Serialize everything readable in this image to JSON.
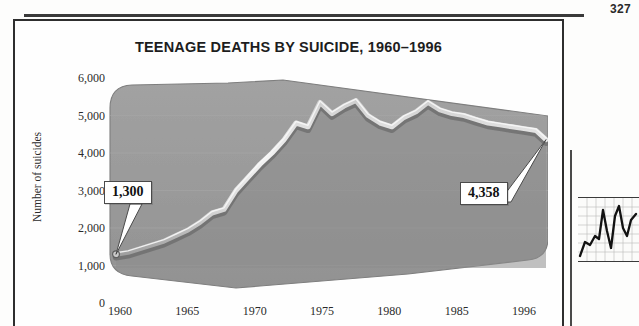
{
  "page": {
    "folio": "327"
  },
  "figure": {
    "title": "TEENAGE DEATHS BY SUICIDE, 1960–1996"
  },
  "callouts": [
    {
      "name": "start-value",
      "text": "1,300"
    },
    {
      "name": "end-value",
      "text": "4,358"
    }
  ],
  "colors": {
    "area_fill": "#9b9b9b",
    "area_fill_dark": "#8a8a8a",
    "line_light": "#f0f0f0",
    "line_shadow": "#6e6e6e",
    "frame": "#2e2e2e",
    "text": "#1d1d1d"
  },
  "chart_data": {
    "type": "line",
    "title": "TEENAGE DEATHS BY SUICIDE, 1960–1996",
    "xlabel": "",
    "ylabel": "Number of suicides",
    "xlim": [
      1960,
      1996
    ],
    "ylim": [
      0,
      6000
    ],
    "yticks": [
      0,
      1000,
      2000,
      3000,
      4000,
      5000,
      6000
    ],
    "ytick_labels": [
      "0",
      "1,000",
      "2,000",
      "3,000",
      "4,000",
      "5,000",
      "6,000"
    ],
    "xticks": [
      1960,
      1965,
      1970,
      1975,
      1980,
      1985,
      1996
    ],
    "xtick_labels": [
      "1960",
      "1965",
      "1970",
      "1975",
      "1980",
      "1985",
      "1996"
    ],
    "grid": "horizontal-faint",
    "legend": "none",
    "annotations": [
      {
        "label": "1,300",
        "x": 1960,
        "y": 1300
      },
      {
        "label": "4,358",
        "x": 1996,
        "y": 4358
      }
    ],
    "x": [
      1960,
      1961,
      1962,
      1963,
      1964,
      1965,
      1966,
      1967,
      1968,
      1969,
      1970,
      1971,
      1972,
      1973,
      1974,
      1975,
      1976,
      1977,
      1978,
      1979,
      1980,
      1981,
      1982,
      1983,
      1984,
      1985,
      1986,
      1987,
      1988,
      1989,
      1990,
      1991,
      1992,
      1993,
      1994,
      1995,
      1996
    ],
    "values": [
      1300,
      1350,
      1450,
      1550,
      1650,
      1800,
      1950,
      2150,
      2400,
      2500,
      2950,
      3300,
      3650,
      3950,
      4300,
      4750,
      4700,
      5350,
      5050,
      5250,
      5400,
      5000,
      4800,
      4700,
      4950,
      5100,
      5350,
      5150,
      5050,
      5000,
      4900,
      4800,
      4750,
      4700,
      4650,
      4600,
      4358
    ],
    "series": [
      {
        "name": "Number of suicides",
        "values": [
          1300,
          1350,
          1450,
          1550,
          1650,
          1800,
          1950,
          2150,
          2400,
          2500,
          2950,
          3300,
          3650,
          3950,
          4300,
          4750,
          4700,
          5350,
          5050,
          5250,
          5400,
          5000,
          4800,
          4700,
          4950,
          5100,
          5350,
          5150,
          5050,
          5000,
          4900,
          4800,
          4750,
          4700,
          4650,
          4600,
          4358
        ]
      }
    ]
  },
  "side_figure": {
    "name": "adjacent-line-chart-crop"
  }
}
